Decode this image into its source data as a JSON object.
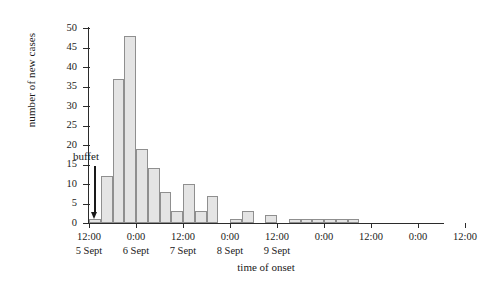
{
  "chart_data": {
    "type": "bar",
    "title": "",
    "xlabel": "time of onset",
    "ylabel": "number of new cases",
    "ylim": [
      0,
      50
    ],
    "yticks": [
      0,
      5,
      10,
      15,
      20,
      25,
      30,
      35,
      40,
      45,
      50
    ],
    "grid": false,
    "legend": null,
    "bin_hours": 3,
    "x_start": "5 Sept 12:00",
    "categories": [
      "5 Sept 12:00",
      "5 Sept 15:00",
      "5 Sept 18:00",
      "5 Sept 21:00",
      "6 Sept 00:00",
      "6 Sept 03:00",
      "6 Sept 06:00",
      "6 Sept 09:00",
      "6 Sept 12:00",
      "6 Sept 15:00",
      "6 Sept 18:00",
      "6 Sept 21:00",
      "7 Sept 00:00",
      "7 Sept 03:00",
      "7 Sept 06:00",
      "7 Sept 09:00",
      "7 Sept 12:00",
      "7 Sept 15:00",
      "7 Sept 18:00",
      "7 Sept 21:00",
      "8 Sept 00:00",
      "8 Sept 03:00",
      "8 Sept 06:00",
      "8 Sept 09:00",
      "8 Sept 12:00",
      "8 Sept 15:00",
      "8 Sept 18:00",
      "8 Sept 21:00",
      "9 Sept 00:00",
      "9 Sept 03:00",
      "9 Sept 06:00",
      "9 Sept 09:00",
      "9 Sept 12:00",
      "9 Sept 15:00",
      "9 Sept 18:00"
    ],
    "values": [
      1,
      12,
      37,
      48,
      19,
      14,
      8,
      3,
      10,
      3,
      7,
      0,
      1,
      3,
      0,
      2,
      0,
      1,
      1,
      1,
      1,
      1,
      1,
      0,
      0,
      0,
      0,
      0,
      0,
      0,
      0,
      0,
      0,
      0,
      0
    ],
    "annotations": [
      {
        "text": "buffet",
        "x": "5 Sept 12:00",
        "y": 17
      }
    ],
    "x_axis": {
      "tick_labels": [
        "12:00",
        "0:00",
        "12:00",
        "0:00",
        "12:00",
        "0:00",
        "12:00",
        "0:00",
        "12:00"
      ],
      "day_labels": [
        "5 Sept",
        "6 Sept",
        "7 Sept",
        "8 Sept",
        "9 Sept"
      ]
    },
    "bar_color": "#e4e4e4",
    "bar_edge_color": "#8f8f8f",
    "axis_color": "#2b2b2b"
  }
}
